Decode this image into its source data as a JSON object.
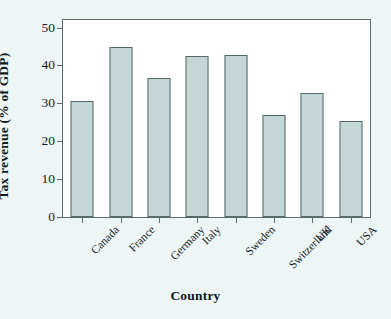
{
  "chart_data": {
    "type": "bar",
    "title": "",
    "xlabel": "Country",
    "ylabel": "Tax revenue (% of GDP)",
    "categories": [
      "Canada",
      "France",
      "Germany",
      "Italy",
      "Sweden",
      "Switzerland",
      "UK",
      "USA"
    ],
    "values": [
      30.5,
      45.0,
      36.6,
      42.4,
      42.7,
      27.0,
      32.8,
      25.3
    ],
    "ylim": [
      0,
      52
    ],
    "yticks": [
      0,
      10,
      20,
      30,
      40,
      50
    ],
    "ytick_labels": [
      "0",
      "10",
      "20",
      "30",
      "40",
      "50"
    ],
    "grid": false,
    "legend": null,
    "bar_color": "#c3d8d6",
    "bar_edge_color": "#566868",
    "axis_color": "#5c6c6c",
    "plot_background": "#ffffff",
    "figure_background": "#eef5f5"
  }
}
